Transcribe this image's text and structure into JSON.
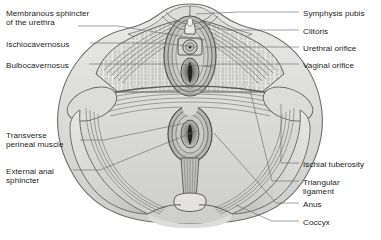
{
  "figure": {
    "kind": "anatomical-illustration",
    "style": "grayscale line drawing with hatched shading",
    "width": 381,
    "height": 240,
    "background_color": "#ffffff",
    "ink_color": "#1b1b1b",
    "leader_line_color": "#6e6e6e"
  },
  "palette": {
    "page": "#ffffff",
    "text": "#1b1b1b",
    "leader": "#6e6e6e",
    "outline_dark": "#4a4a4a",
    "outline_mid": "#777777",
    "skin_light": "#e2e2e0",
    "skin_mid": "#d2d2d0",
    "skin_shadow": "#bdbdbb",
    "muscle_light": "#c8c8c6",
    "muscle_mid": "#a9a9a7",
    "muscle_dark": "#8a8a88",
    "hatch": "#f2f2f0",
    "orifice_dark": "#3a3a3a",
    "bone_light": "#dedcd8"
  },
  "labels": {
    "left": [
      {
        "id": "membranous-sphincter-of-the-urethra",
        "lines": [
          "Membranous sphincter",
          "of the urethra"
        ],
        "x": 6,
        "y": 9
      },
      {
        "id": "ischiocavernosus",
        "lines": [
          "Ischiocavernosus"
        ],
        "x": 6,
        "y": 40
      },
      {
        "id": "bulbocavernosus",
        "lines": [
          "Bulbocavernosus"
        ],
        "x": 6,
        "y": 61
      },
      {
        "id": "transverse-perineal-muscle",
        "lines": [
          "Transverse",
          "perineal muscle"
        ],
        "x": 6,
        "y": 131
      },
      {
        "id": "external-anal-sphincter",
        "lines": [
          "External anal",
          "sphincter"
        ],
        "x": 6,
        "y": 167
      }
    ],
    "right": [
      {
        "id": "symphysis-pubis",
        "lines": [
          "Symphysis pubis"
        ],
        "x": 303,
        "y": 9
      },
      {
        "id": "clitoris",
        "lines": [
          "Clitoris"
        ],
        "x": 303,
        "y": 27
      },
      {
        "id": "urethral-orifice",
        "lines": [
          "Urethral orifice"
        ],
        "x": 303,
        "y": 44
      },
      {
        "id": "vaginal-orifice",
        "lines": [
          "Vaginal orifice"
        ],
        "x": 303,
        "y": 61
      },
      {
        "id": "ischial-tuberosity",
        "lines": [
          "Ischial tuberosity"
        ],
        "x": 303,
        "y": 160
      },
      {
        "id": "triangular-ligament",
        "lines": [
          "Triangular",
          "ligament"
        ],
        "x": 303,
        "y": 178
      },
      {
        "id": "anus",
        "lines": [
          "Anus"
        ],
        "x": 303,
        "y": 200
      },
      {
        "id": "coccyx",
        "lines": [
          "Coccyx"
        ],
        "x": 303,
        "y": 218
      }
    ]
  },
  "leaders": {
    "membranous_sphincter": "M 78,26 L 118,26 L 205,40",
    "ischiocavernosus": "M 90,43 L 162,43 L 196,47",
    "bulbocavernosus": "M 89,64 L 180,64 L 214,67",
    "transverse_perineal": "M 80,140 L 104,140 L 186,123",
    "external_anal_sphincter": "M 73,170 L 100,170 L 196,131",
    "symphysis_pubis": "M 299,12 L 238,12 L 196,14",
    "clitoris": "M 299,30 L 226,30 L 200,22",
    "urethral_orifice": "M 299,47 L 222,47 L 205,47",
    "vaginal_orifice": "M 299,64 L 218,64 L 204,66",
    "ischial_tuberosity": "M 299,163 L 281,163 L 281,104",
    "triangular_ligament": "M 299,181 L 272,181 L 250,90",
    "anus": "M 299,203 L 276,203 L 214,133",
    "coccyx": "M 299,221 L 272,221 L 236,205"
  }
}
